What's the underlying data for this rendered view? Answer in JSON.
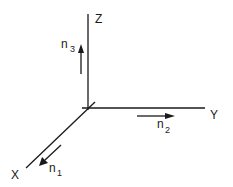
{
  "diagram": {
    "type": "3d-coordinate-axes",
    "axes": {
      "z": {
        "label": "Z"
      },
      "y": {
        "label": "Y"
      },
      "x": {
        "label": "X"
      }
    },
    "vectors": [
      {
        "name": "n3",
        "base": "n",
        "subscript": "3",
        "direction": "along +Z"
      },
      {
        "name": "n2",
        "base": "n",
        "subscript": "2",
        "direction": "along +Y"
      },
      {
        "name": "n1",
        "base": "n",
        "subscript": "1",
        "direction": "along +X"
      }
    ],
    "colors": {
      "stroke": "#1a1a1a",
      "background": "#ffffff"
    }
  }
}
